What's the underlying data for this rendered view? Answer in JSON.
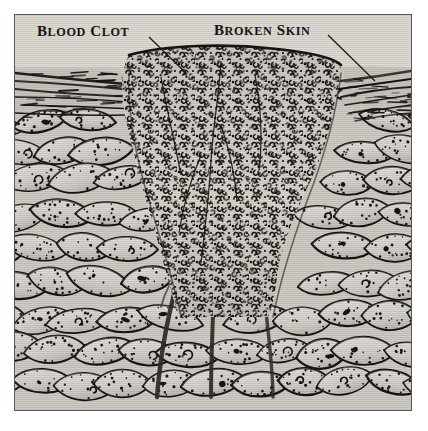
{
  "figure": {
    "kind": "anatomical-illustration",
    "background_color": "#dedad4",
    "ink_color": "#171412",
    "panel_border_color": "#5a5752",
    "page_color": "#ffffff"
  },
  "labels": [
    {
      "id": "blood-clot",
      "text": "BLOOD CLOT",
      "first_letter": "B",
      "rest": "LOOD",
      "second_word_first": "C",
      "second_word_rest": "LOT",
      "x": 36,
      "y": 23,
      "leader": {
        "x1": 148,
        "y1": 36,
        "x2": 186,
        "y2": 73
      }
    },
    {
      "id": "broken-skin",
      "text": "BROKEN SKIN",
      "first_letter": "B",
      "rest": "ROKEN",
      "second_word_first": "S",
      "second_word_rest": "KIN",
      "x": 213,
      "y": 22,
      "leader": {
        "x1": 327,
        "y1": 34,
        "x2": 374,
        "y2": 80
      }
    }
  ],
  "regions": [
    {
      "id": "blood-clot-mass",
      "name": "Blood clot",
      "description": "Dense granular wedge of clotted blood and fibrin filling the wound",
      "shape": "downward-tapering wedge",
      "top_span_x": [
        128,
        338
      ],
      "bottom_tip_x": [
        182,
        272
      ],
      "top_y": 62,
      "bottom_y": 300,
      "fill": "#d6d2cc",
      "texture": "fine dark comma and ring marks"
    },
    {
      "id": "skin-surface",
      "name": "Broken skin surface",
      "description": "Horizontal striated keratin layers of the epidermis, torn open at the wound",
      "left_break_x": 128,
      "right_break_x": 338,
      "y": 70,
      "fill": "#c9c4bd"
    },
    {
      "id": "tissue-cells",
      "name": "Tissue cell layers",
      "description": "Rows of elongated lens-shaped cells with stippled borders and dark nuclei",
      "fill": "#cfcbc5",
      "outline": "#171412",
      "rows": 9
    },
    {
      "id": "vessels",
      "name": "Blood vessels",
      "description": "Dark capillary channels descending from the clot through the tissue",
      "count": 3,
      "color": "#33302c"
    }
  ],
  "canvas": {
    "width": 428,
    "height": 431,
    "panel_x": 14,
    "panel_y": 14,
    "panel_w": 398,
    "panel_h": 397
  }
}
